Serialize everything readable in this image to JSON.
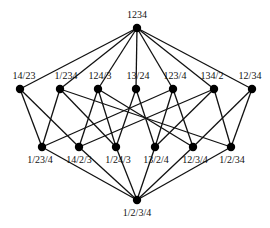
{
  "diagram": {
    "nodes": [
      {
        "id": "1234",
        "label": "1234",
        "x": 137,
        "y": 28,
        "lx": 137,
        "ly": 18,
        "anchor": "middle"
      },
      {
        "id": "14/23",
        "label": "14/23",
        "x": 20,
        "y": 89,
        "lx": 24,
        "ly": 79,
        "anchor": "middle"
      },
      {
        "id": "1/234",
        "label": "1/234",
        "x": 60,
        "y": 89,
        "lx": 66,
        "ly": 79,
        "anchor": "middle"
      },
      {
        "id": "124/3",
        "label": "124/3",
        "x": 98,
        "y": 89,
        "lx": 100,
        "ly": 79,
        "anchor": "middle"
      },
      {
        "id": "13/24",
        "label": "13/24",
        "x": 136,
        "y": 89,
        "lx": 138,
        "ly": 79,
        "anchor": "middle"
      },
      {
        "id": "123/4",
        "label": "123/4",
        "x": 173,
        "y": 89,
        "lx": 175,
        "ly": 79,
        "anchor": "middle"
      },
      {
        "id": "134/2",
        "label": "134/2",
        "x": 214,
        "y": 89,
        "lx": 212,
        "ly": 79,
        "anchor": "middle"
      },
      {
        "id": "12/34",
        "label": "12/34",
        "x": 252,
        "y": 89,
        "lx": 250,
        "ly": 79,
        "anchor": "middle"
      },
      {
        "id": "1/23/4",
        "label": "1/23/4",
        "x": 42,
        "y": 147,
        "lx": 40,
        "ly": 163,
        "anchor": "middle"
      },
      {
        "id": "14/2/3",
        "label": "14/2/3",
        "x": 79,
        "y": 147,
        "lx": 79,
        "ly": 163,
        "anchor": "middle"
      },
      {
        "id": "1/24/3",
        "label": "1/24/3",
        "x": 116,
        "y": 147,
        "lx": 118,
        "ly": 163,
        "anchor": "middle"
      },
      {
        "id": "13/2/4",
        "label": "13/2/4",
        "x": 155,
        "y": 147,
        "lx": 156,
        "ly": 163,
        "anchor": "middle"
      },
      {
        "id": "12/3/4",
        "label": "12/3/4",
        "x": 193,
        "y": 147,
        "lx": 195,
        "ly": 163,
        "anchor": "middle"
      },
      {
        "id": "1/2/34",
        "label": "1/2/34",
        "x": 231,
        "y": 147,
        "lx": 232,
        "ly": 163,
        "anchor": "middle"
      },
      {
        "id": "1/2/3/4",
        "label": "1/2/3/4",
        "x": 137,
        "y": 200,
        "lx": 137,
        "ly": 216,
        "anchor": "middle"
      }
    ],
    "edges": [
      [
        "1234",
        "14/23"
      ],
      [
        "1234",
        "1/234"
      ],
      [
        "1234",
        "124/3"
      ],
      [
        "1234",
        "13/24"
      ],
      [
        "1234",
        "123/4"
      ],
      [
        "1234",
        "134/2"
      ],
      [
        "1234",
        "12/34"
      ],
      [
        "1/23/4",
        "14/23"
      ],
      [
        "1/23/4",
        "1/234"
      ],
      [
        "1/23/4",
        "123/4"
      ],
      [
        "14/2/3",
        "14/23"
      ],
      [
        "14/2/3",
        "124/3"
      ],
      [
        "14/2/3",
        "134/2"
      ],
      [
        "1/24/3",
        "1/234"
      ],
      [
        "1/24/3",
        "124/3"
      ],
      [
        "1/24/3",
        "13/24"
      ],
      [
        "13/2/4",
        "13/24"
      ],
      [
        "13/2/4",
        "123/4"
      ],
      [
        "13/2/4",
        "134/2"
      ],
      [
        "12/3/4",
        "124/3"
      ],
      [
        "12/3/4",
        "123/4"
      ],
      [
        "12/3/4",
        "12/34"
      ],
      [
        "1/2/34",
        "1/234"
      ],
      [
        "1/2/34",
        "134/2"
      ],
      [
        "1/2/34",
        "12/34"
      ],
      [
        "1/2/3/4",
        "1/23/4"
      ],
      [
        "1/2/3/4",
        "14/2/3"
      ],
      [
        "1/2/3/4",
        "1/24/3"
      ],
      [
        "1/2/3/4",
        "13/2/4"
      ],
      [
        "1/2/3/4",
        "12/3/4"
      ],
      [
        "1/2/3/4",
        "1/2/34"
      ]
    ],
    "colors": {
      "line": "#111111",
      "node": "#000000",
      "text": "#111111"
    }
  }
}
